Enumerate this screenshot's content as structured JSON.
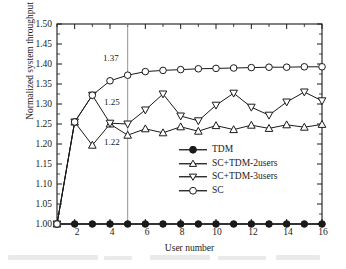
{
  "chart_data": {
    "type": "line",
    "title": "",
    "xlabel": "User number",
    "ylabel": "Normalized system throughput",
    "xlim": [
      1,
      16
    ],
    "ylim": [
      1.0,
      1.5
    ],
    "grid": false,
    "legend_position": "center",
    "x": [
      1,
      2,
      3,
      4,
      5,
      6,
      7,
      8,
      9,
      10,
      11,
      12,
      13,
      14,
      15,
      16
    ],
    "xticks": [
      2,
      4,
      6,
      8,
      10,
      12,
      14,
      16
    ],
    "xtick_labels": [
      "2",
      "4",
      "6",
      "8",
      "10",
      "12",
      "14",
      "16"
    ],
    "yticks": [
      1.0,
      1.05,
      1.1,
      1.15,
      1.2,
      1.25,
      1.3,
      1.35,
      1.4,
      1.45,
      1.5
    ],
    "ytick_labels": [
      "1.00",
      "1.05",
      "1.10",
      "1.15",
      "1.20",
      "1.25",
      "1.30",
      "1.35",
      "1.40",
      "1.45",
      "1.50"
    ],
    "series": [
      {
        "name": "TDM",
        "marker": "filled-circle",
        "values": [
          1.0,
          1.0,
          1.0,
          1.0,
          1.0,
          1.0,
          1.0,
          1.0,
          1.0,
          1.0,
          1.0,
          1.0,
          1.0,
          1.0,
          1.0,
          1.0
        ]
      },
      {
        "name": "SC+TDM-2users",
        "marker": "open-up-triangle",
        "values": [
          1.0,
          1.255,
          1.197,
          1.25,
          1.222,
          1.238,
          1.228,
          1.243,
          1.232,
          1.246,
          1.236,
          1.247,
          1.239,
          1.248,
          1.242,
          1.249
        ]
      },
      {
        "name": "SC+TDM-3users",
        "marker": "open-down-triangle",
        "values": [
          1.0,
          1.255,
          1.322,
          1.252,
          1.25,
          1.285,
          1.325,
          1.27,
          1.258,
          1.297,
          1.327,
          1.292,
          1.272,
          1.305,
          1.33,
          1.308
        ]
      },
      {
        "name": "SC",
        "marker": "open-circle",
        "values": [
          1.0,
          1.255,
          1.322,
          1.358,
          1.372,
          1.381,
          1.384,
          1.386,
          1.388,
          1.389,
          1.39,
          1.391,
          1.392,
          1.392,
          1.393,
          1.393
        ]
      }
    ],
    "annotations": [
      {
        "text": "1.37",
        "x": 5,
        "y": 1.395,
        "series": "SC"
      },
      {
        "text": "1.25",
        "x": 5,
        "y": 1.285,
        "series": "SC+TDM-3users"
      },
      {
        "text": "1.22",
        "x": 5,
        "y": 1.195,
        "series": "SC+TDM-2users"
      }
    ],
    "vertical_marker": {
      "x": 5,
      "label": ""
    },
    "colors": {
      "line": "#1a1a1a",
      "marker_fill": "#ffffff",
      "tdm_marker_fill": "#1a1a1a",
      "background": "#ffffff",
      "axis": "#1a1a1a"
    }
  },
  "legend": {
    "items": [
      {
        "label": "TDM"
      },
      {
        "label": "SC+TDM-2users"
      },
      {
        "label": "SC+TDM-3users"
      },
      {
        "label": "SC"
      }
    ]
  }
}
